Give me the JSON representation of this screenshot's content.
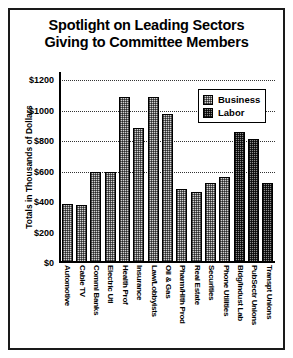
{
  "chart_data": {
    "type": "bar",
    "title": "Spotlight on Leading Sectors Giving to Committee Members",
    "title_lines": [
      "Spotlight on Leading Sectors",
      "Giving to Committee Members"
    ],
    "xlabel": "",
    "ylabel": "Totals in Thousands of Dollars",
    "ylim": [
      0,
      1200
    ],
    "ytick_step": 200,
    "ytick_labels": [
      "$1200",
      "$1000",
      "$800",
      "$600",
      "$400",
      "$200",
      "$0"
    ],
    "ytick_values": [
      1200,
      1000,
      800,
      600,
      400,
      200,
      0
    ],
    "grid": true,
    "legend_position": "upper-right",
    "legend": [
      {
        "name": "Business",
        "pattern": "light-dotted",
        "color": "#d2d2d2"
      },
      {
        "name": "Labor",
        "pattern": "dark-crosshatch",
        "color": "#8a8a8a"
      }
    ],
    "categories": [
      "Automotive",
      "Cable TV",
      "Comml Banks",
      "Electric Utl",
      "Health Prof",
      "Insurance",
      "Law/Lobbyists",
      "Oil & Gas",
      "Pharm/Hlth Prod",
      "Real Estate",
      "Securities",
      "Phone Utilities",
      "Bldg/Indust Lab",
      "PubSectr Unions",
      "Transpt Unions"
    ],
    "values": [
      385,
      380,
      595,
      600,
      1090,
      885,
      1090,
      975,
      485,
      465,
      525,
      565,
      860,
      815,
      525
    ],
    "groups": [
      "Business",
      "Business",
      "Business",
      "Business",
      "Business",
      "Business",
      "Business",
      "Business",
      "Business",
      "Business",
      "Business",
      "Business",
      "Labor",
      "Labor",
      "Labor"
    ]
  }
}
